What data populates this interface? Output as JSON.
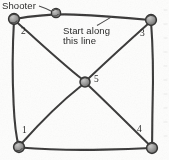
{
  "figure": {
    "annotations": {
      "shooter_label": "Shooter",
      "start_note_line1": "Start along",
      "start_note_line2": "this line"
    },
    "vertex_labels": {
      "bottom_left": "1",
      "top_left": "2",
      "top_right": "3",
      "bottom_right": "4",
      "center": "5"
    },
    "colors": {
      "ink": "#2b2b28",
      "marble_fill": "#8f8d88",
      "marble_outline": "#3a3935",
      "paper": "#fdfdfb"
    },
    "marbles": [
      {
        "name": "marble-2-top-left",
        "label": "2",
        "cx": 14,
        "cy": 19,
        "r": 5.4
      },
      {
        "name": "marble-3-top-right",
        "label": "3",
        "cx": 151,
        "cy": 20,
        "r": 5.4
      },
      {
        "name": "marble-1-bottom-left",
        "label": "1",
        "cx": 19,
        "cy": 147,
        "r": 5.4
      },
      {
        "name": "marble-4-bottom-right",
        "label": "4",
        "cx": 152,
        "cy": 148,
        "r": 5.4
      },
      {
        "name": "marble-5-center",
        "label": "5",
        "cx": 85,
        "cy": 82,
        "r": 5.0
      },
      {
        "name": "marble-shooter",
        "label": "Shooter",
        "cx": 56,
        "cy": 13,
        "r": 4.6
      }
    ]
  }
}
